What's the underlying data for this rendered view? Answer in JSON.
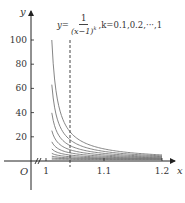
{
  "chart_data": {
    "type": "line",
    "formula": {
      "lhs": "y=",
      "numerator": "1",
      "denominator": "(x−1)",
      "exponent": "k",
      "suffix": ",k=0.1,0.2,···,1"
    },
    "xlabel": "x",
    "ylabel": "y",
    "origin_label": "O",
    "x_ticks": [
      "1",
      "1.1",
      "1.2"
    ],
    "y_ticks": [
      "20",
      "40",
      "60",
      "80",
      "100"
    ],
    "xlim": [
      1.0,
      1.2
    ],
    "ylim": [
      0,
      100
    ],
    "axis_break": true,
    "dashed_line_x": 1.04,
    "series": [
      {
        "name": "k=1.0",
        "k": 1.0
      },
      {
        "name": "k=0.9",
        "k": 0.9
      },
      {
        "name": "k=0.8",
        "k": 0.8
      },
      {
        "name": "k=0.7",
        "k": 0.7
      },
      {
        "name": "k=0.6",
        "k": 0.6
      },
      {
        "name": "k=0.5",
        "k": 0.5
      },
      {
        "name": "k=0.4",
        "k": 0.4
      },
      {
        "name": "k=0.3",
        "k": 0.3
      },
      {
        "name": "k=0.2",
        "k": 0.2
      },
      {
        "name": "k=0.1",
        "k": 0.1
      }
    ],
    "grid": false,
    "curve_color": "#777777",
    "axis_color": "#222222"
  }
}
